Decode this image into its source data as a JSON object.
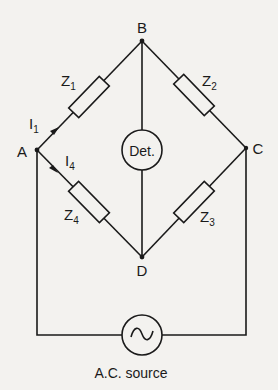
{
  "diagram": {
    "type": "ac-bridge-circuit",
    "nodes": {
      "A": {
        "label": "A"
      },
      "B": {
        "label": "B"
      },
      "C": {
        "label": "C"
      },
      "D": {
        "label": "D"
      }
    },
    "impedances": [
      {
        "id": "Z1",
        "base": "Z",
        "sub": "1",
        "from": "A",
        "to": "B"
      },
      {
        "id": "Z2",
        "base": "Z",
        "sub": "2",
        "from": "B",
        "to": "C"
      },
      {
        "id": "Z3",
        "base": "Z",
        "sub": "3",
        "from": "C",
        "to": "D"
      },
      {
        "id": "Z4",
        "base": "Z",
        "sub": "4",
        "from": "A",
        "to": "D"
      }
    ],
    "currents": [
      {
        "id": "I1",
        "base": "I",
        "sub": "1",
        "branch": "A-B"
      },
      {
        "id": "I4",
        "base": "I",
        "sub": "4",
        "branch": "A-D"
      }
    ],
    "detector": {
      "label": "Det.",
      "from": "B",
      "to": "D"
    },
    "source": {
      "label": "A.C. source",
      "symbol": "~",
      "from": "A",
      "to": "C"
    }
  }
}
